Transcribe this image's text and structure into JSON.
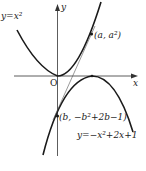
{
  "diagram": {
    "labels": {
      "y_axis": "y",
      "x_axis": "x",
      "origin": "O",
      "curve_upper": "y=x²",
      "curve_lower": "y=−x²+2x+1",
      "point_a": "(a, a²)",
      "point_b": "(b, −b²+2b−1)"
    },
    "colors": {
      "curve": "#1a1a1a",
      "axis": "#333333",
      "tangent": "#555555"
    }
  }
}
